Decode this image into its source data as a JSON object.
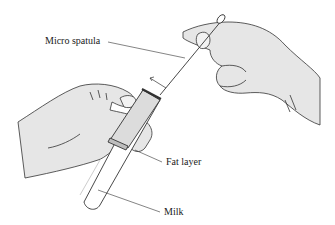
{
  "diagram": {
    "labels": {
      "micro_spatula": "Micro spatula",
      "fat_layer": "Fat layer",
      "milk": "Milk"
    },
    "colors": {
      "line": "#333333",
      "skin_fill": "#e6e6e6",
      "tube_fill": "#ffffff",
      "fat_fill": "#cfcfcf",
      "background": "#ffffff"
    }
  }
}
